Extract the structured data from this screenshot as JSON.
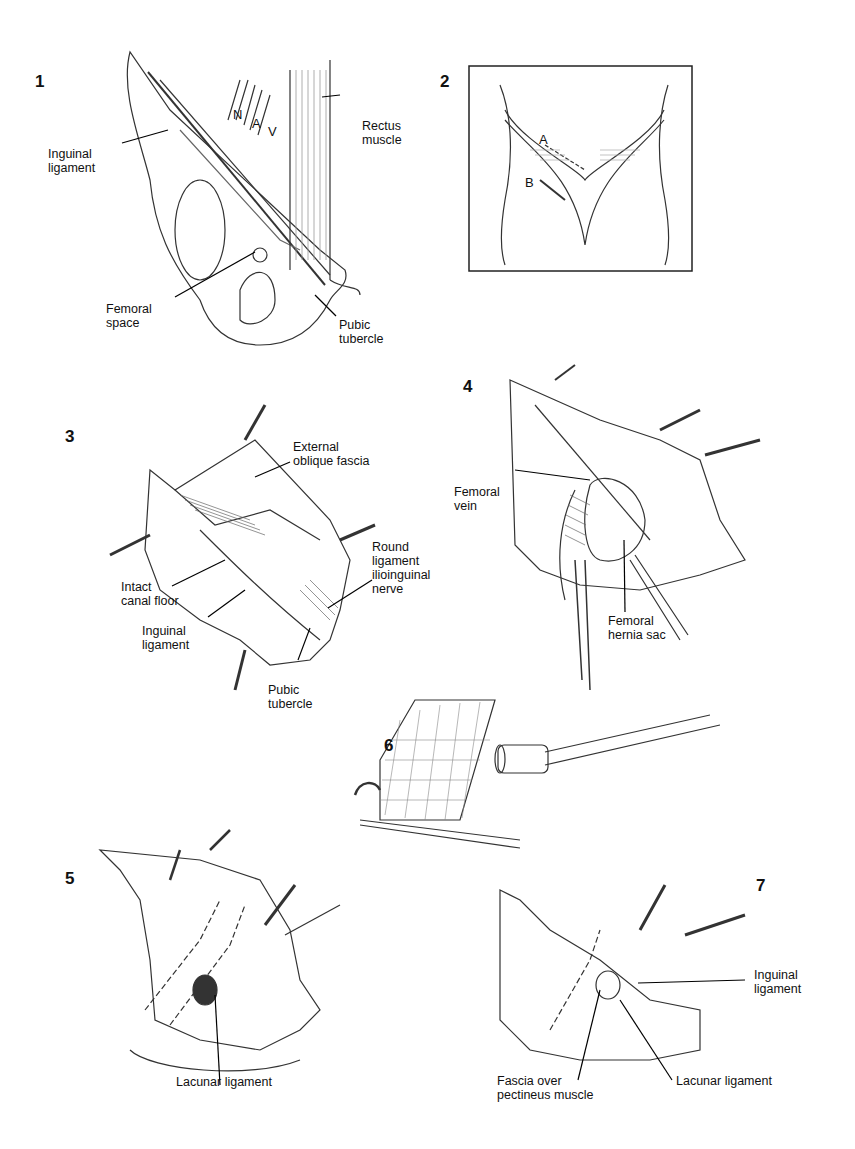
{
  "page": {
    "type": "surgical-illustration-plate"
  },
  "figures": [
    {
      "number": "1",
      "labels": [
        "N",
        "A",
        "V",
        "Rectus\nmuscle",
        "Inguinal\nligament",
        "Femoral\nspace",
        "Pubic\ntubercle"
      ]
    },
    {
      "number": "2",
      "labels": [
        "A",
        "B"
      ]
    },
    {
      "number": "3",
      "labels": [
        "External\noblique fascia",
        "Round\nligament\nilioinguinal\nnerve",
        "Intact\ncanal floor",
        "Inguinal\nligament",
        "Pubic\ntubercle"
      ]
    },
    {
      "number": "4",
      "labels": [
        "Femoral\nvein",
        "Femoral\nhernia sac"
      ]
    },
    {
      "number": "5",
      "labels": [
        "Lacunar ligament"
      ]
    },
    {
      "number": "6",
      "labels": []
    },
    {
      "number": "7",
      "labels": [
        "Inguinal\nligament",
        "Fascia over\npectineus muscle",
        "Lacunar ligament"
      ]
    }
  ]
}
